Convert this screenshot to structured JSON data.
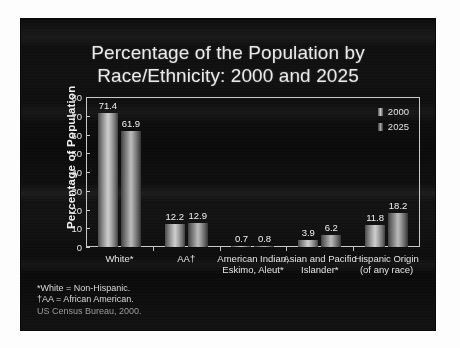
{
  "slide": {
    "title_line1": "Percentage of the Population by",
    "title_line2": "Race/Ethnicity: 2000 and 2025"
  },
  "chart_data": {
    "type": "bar",
    "title": "Percentage of the Population by Race/Ethnicity: 2000 and 2025",
    "xlabel": "",
    "ylabel": "Percentage of Population",
    "ylim": [
      0,
      80
    ],
    "yticks": [
      "0",
      "10",
      "20",
      "30",
      "40",
      "50",
      "60",
      "70",
      "80"
    ],
    "grid": false,
    "legend_position": "top-right",
    "categories": [
      "White*",
      "AA†",
      "American Indian, Eskimo, Aleut*",
      "Asian and Pacific Islander*",
      "Hispanic Origin (of any race)"
    ],
    "category_lines": [
      {
        "l1": "White*",
        "l2": ""
      },
      {
        "l1": "AA†",
        "l2": ""
      },
      {
        "l1": "American Indian,",
        "l2": "Eskimo, Aleut*"
      },
      {
        "l1": "Asian and Pacific",
        "l2": "Islander*"
      },
      {
        "l1": "Hispanic Origin",
        "l2": "(of any race)"
      }
    ],
    "series": [
      {
        "name": "2000",
        "values": [
          71.4,
          12.2,
          0.7,
          3.9,
          11.8
        ]
      },
      {
        "name": "2025",
        "values": [
          61.9,
          12.9,
          0.8,
          6.2,
          18.2
        ]
      }
    ],
    "value_labels": [
      [
        "71.4",
        "61.9"
      ],
      [
        "12.2",
        "12.9"
      ],
      [
        "0.7",
        "0.8"
      ],
      [
        "3.9",
        "6.2"
      ],
      [
        "11.8",
        "18.2"
      ]
    ]
  },
  "legend": {
    "items": [
      {
        "label": "2000"
      },
      {
        "label": "2025"
      }
    ]
  },
  "footnotes": [
    "*White = Non-Hispanic.",
    "†AA = African American.",
    "US Census Bureau, 2000."
  ],
  "colors": {
    "slide_background": "#0c0c0c",
    "text": "#e9e9e9",
    "frame": "#c9c9c9",
    "bar_2000": "#cfcfcf",
    "bar_2025": "#bcbcbc"
  }
}
